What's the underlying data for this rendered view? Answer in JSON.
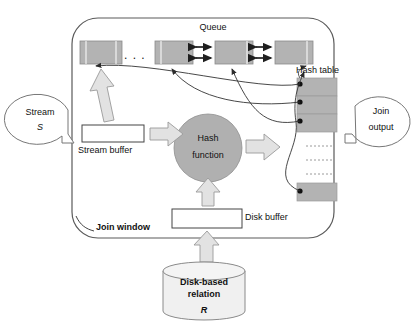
{
  "diagram": {
    "type": "block-flow-diagram"
  },
  "colors": {
    "cell_fill": "#b3b3b3",
    "cell_stroke": "#8a8a8a",
    "arrow_fill": "#e2e2e2",
    "arrow_stroke": "#9a9a9a",
    "circle_fill": "#b0b0b0",
    "circle_stroke": "#8f8f8f",
    "line": "#4a4a4a",
    "box_fill": "#ffffff",
    "box_stroke": "#555555",
    "cylinder_fill": "#f0f0f0",
    "cylinder_stroke": "#8a8a8a",
    "callout_stroke": "#777777"
  },
  "labels": {
    "queue": "Queue",
    "hash_table": "Hash table",
    "hash_function_line1": "Hash",
    "hash_function_line2": "function",
    "stream_buffer": "Stream buffer",
    "disk_buffer": "Disk buffer",
    "join_window": "Join window",
    "ellipsis": ". . .",
    "stream_callout_line1": "Stream",
    "stream_callout_line2": "S",
    "join_output_line1": "Join",
    "join_output_line2": "output",
    "relation_line1": "Disk-based",
    "relation_line2": "relation",
    "relation_line3": "R"
  },
  "queue": {
    "cells": [
      {
        "id": "q1",
        "x": 80,
        "y": 41,
        "w": 42,
        "h": 23
      },
      {
        "id": "q2",
        "x": 155,
        "y": 41,
        "w": 38,
        "h": 23
      },
      {
        "id": "q3",
        "x": 215,
        "y": 41,
        "w": 38,
        "h": 23
      },
      {
        "id": "q4",
        "x": 275,
        "y": 41,
        "w": 38,
        "h": 23
      }
    ],
    "connector_links": [
      {
        "from": "q2",
        "to": "q3"
      },
      {
        "from": "q3",
        "to": "q4"
      }
    ],
    "ellipsis_x": 131,
    "ellipsis_y": 57
  },
  "hash_table": {
    "cells": [
      {
        "id": "h1",
        "x": 297,
        "y": 78,
        "w": 40,
        "h": 18
      },
      {
        "id": "h2",
        "x": 297,
        "y": 96,
        "w": 40,
        "h": 18
      },
      {
        "id": "h3",
        "x": 297,
        "y": 114,
        "w": 40,
        "h": 18
      },
      {
        "id": "h4",
        "x": 297,
        "y": 183,
        "w": 40,
        "h": 18
      }
    ],
    "bullets": [
      {
        "cx": 300,
        "cy": 84
      },
      {
        "cx": 300,
        "cy": 102
      },
      {
        "cx": 300,
        "cy": 121
      },
      {
        "cx": 300,
        "cy": 191
      }
    ],
    "omitted_rows_marks": [
      {
        "x": 306,
        "y": 146
      },
      {
        "x": 306,
        "y": 160
      },
      {
        "x": 306,
        "y": 174
      }
    ]
  },
  "boxes": {
    "stream_buffer": {
      "x": 82,
      "y": 125,
      "w": 62,
      "h": 17
    },
    "disk_buffer": {
      "x": 172,
      "y": 209,
      "w": 70,
      "h": 19
    }
  },
  "hash_circle": {
    "cx": 208,
    "cy": 148,
    "r": 34
  },
  "join_window_frame": {
    "x": 72,
    "y": 18,
    "w": 262,
    "h": 220,
    "rx": 24
  },
  "cylinder": {
    "x": 163,
    "y": 262,
    "w": 82,
    "h": 58,
    "ellipse_ry": 9
  },
  "callouts": {
    "stream": {
      "cx": 40,
      "cy": 118,
      "rx": 33,
      "ry": 25
    },
    "join_output": {
      "cx": 381,
      "cy": 118,
      "rx": 31,
      "ry": 25
    }
  },
  "block_arrows": [
    {
      "name": "stream-buffer-to-queue",
      "direction": "up-left-tilted"
    },
    {
      "name": "stream-buffer-to-hash-function",
      "direction": "right"
    },
    {
      "name": "hash-function-to-output",
      "direction": "right"
    },
    {
      "name": "disk-buffer-to-hash-function",
      "direction": "up"
    },
    {
      "name": "relation-to-disk-buffer",
      "direction": "up"
    }
  ]
}
